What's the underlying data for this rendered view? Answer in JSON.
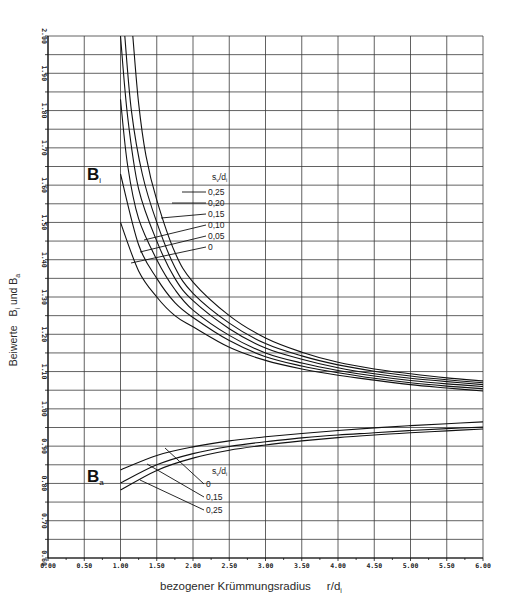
{
  "chart_data": {
    "type": "line",
    "title": "",
    "xlabel": "bezogener Krümmungsradius",
    "xlabel_unit": "r/d",
    "xlabel_unit_sub": "i",
    "ylabel": "Beiwerte",
    "ylabel_parts": [
      "B",
      "i",
      " und ",
      "B",
      "a"
    ],
    "xlim": [
      0,
      6
    ],
    "ylim": [
      0.6,
      2.0
    ],
    "x_ticks": [
      "0.00",
      "0.50",
      "1.00",
      "1.50",
      "2.00",
      "2.50",
      "3.00",
      "3.50",
      "4.00",
      "4.50",
      "5.00",
      "5.50",
      "6.00"
    ],
    "y_ticks": [
      "0.60",
      "0.70",
      "0.80",
      "0.90",
      "1.00",
      "1.10",
      "1.20",
      "1.30",
      "1.40",
      "1.50",
      "1.60",
      "1.70",
      "1.80",
      "1.90",
      "2.00"
    ],
    "grid": true,
    "legend_header": "s",
    "legend_header_sub": "v",
    "legend_header_tail": "/d",
    "legend_header_tail_sub": "i",
    "groups": [
      {
        "name": "B_i",
        "label": "B",
        "label_sub": "i",
        "series": [
          {
            "name": "0",
            "x": [
              1.0,
              1.25,
              1.5,
              1.75,
              2.0,
              2.5,
              3.0,
              3.5,
              4.0,
              4.5,
              5.0,
              5.5,
              6.0
            ],
            "y": [
              1.5,
              1.37,
              1.3,
              1.25,
              1.22,
              1.165,
              1.13,
              1.107,
              1.09,
              1.077,
              1.065,
              1.056,
              1.048
            ]
          },
          {
            "name": "0,05",
            "x": [
              1.0,
              1.25,
              1.5,
              1.75,
              2.0,
              2.5,
              3.0,
              3.5,
              4.0,
              4.5,
              5.0,
              5.5,
              6.0
            ],
            "y": [
              1.63,
              1.44,
              1.35,
              1.285,
              1.245,
              1.183,
              1.14,
              1.115,
              1.097,
              1.082,
              1.07,
              1.061,
              1.054
            ]
          },
          {
            "name": "0,10",
            "x": [
              1.0,
              1.1,
              1.25,
              1.5,
              1.75,
              2.0,
              2.5,
              3.0,
              3.5,
              4.0,
              4.5,
              5.0,
              5.5,
              6.0
            ],
            "y": [
              1.83,
              1.65,
              1.51,
              1.4,
              1.32,
              1.265,
              1.197,
              1.15,
              1.123,
              1.103,
              1.088,
              1.076,
              1.067,
              1.06
            ]
          },
          {
            "name": "0,15",
            "x": [
              1.0,
              1.1,
              1.25,
              1.5,
              1.75,
              2.0,
              2.5,
              3.0,
              3.5,
              4.0,
              4.5,
              5.0,
              5.5,
              6.0
            ],
            "y": [
              2.0,
              1.78,
              1.59,
              1.45,
              1.35,
              1.29,
              1.215,
              1.163,
              1.133,
              1.11,
              1.094,
              1.082,
              1.073,
              1.065
            ]
          },
          {
            "name": "0,20",
            "x": [
              1.06,
              1.15,
              1.3,
              1.5,
              1.75,
              2.0,
              2.5,
              3.0,
              3.5,
              4.0,
              4.5,
              5.0,
              5.5,
              6.0
            ],
            "y": [
              2.0,
              1.8,
              1.63,
              1.5,
              1.38,
              1.31,
              1.23,
              1.175,
              1.142,
              1.118,
              1.101,
              1.088,
              1.078,
              1.07
            ]
          },
          {
            "name": "0,25",
            "x": [
              1.17,
              1.25,
              1.35,
              1.5,
              1.75,
              2.0,
              2.5,
              3.0,
              3.5,
              4.0,
              4.5,
              5.0,
              5.5,
              6.0
            ],
            "y": [
              2.0,
              1.82,
              1.68,
              1.56,
              1.42,
              1.34,
              1.25,
              1.19,
              1.152,
              1.125,
              1.107,
              1.094,
              1.083,
              1.075
            ]
          }
        ]
      },
      {
        "name": "B_a",
        "label": "B",
        "label_sub": "a",
        "series": [
          {
            "name": "0",
            "x": [
              1.0,
              1.5,
              2.0,
              2.5,
              3.0,
              3.5,
              4.0,
              4.5,
              5.0,
              5.5,
              6.0
            ],
            "y": [
              0.836,
              0.875,
              0.898,
              0.914,
              0.925,
              0.934,
              0.942,
              0.949,
              0.955,
              0.96,
              0.965
            ]
          },
          {
            "name": "0,15",
            "x": [
              1.0,
              1.5,
              2.0,
              2.5,
              3.0,
              3.5,
              4.0,
              4.5,
              5.0,
              5.5,
              6.0
            ],
            "y": [
              0.801,
              0.85,
              0.88,
              0.899,
              0.912,
              0.922,
              0.93,
              0.936,
              0.942,
              0.947,
              0.951
            ]
          },
          {
            "name": "0,25",
            "x": [
              1.0,
              1.5,
              2.0,
              2.5,
              3.0,
              3.5,
              4.0,
              4.5,
              5.0,
              5.5,
              6.0
            ],
            "y": [
              0.782,
              0.835,
              0.868,
              0.889,
              0.903,
              0.914,
              0.923,
              0.93,
              0.936,
              0.941,
              0.946
            ]
          }
        ]
      }
    ],
    "annotations": {
      "bi_labels": [
        {
          "text": "0,25",
          "px": 208,
          "py": 192,
          "tx": 182,
          "ty": 192
        },
        {
          "text": "0,20",
          "px": 208,
          "py": 203,
          "tx": 172,
          "ty": 203
        },
        {
          "text": "0,15",
          "px": 208,
          "py": 214,
          "tx": 161,
          "ty": 218
        },
        {
          "text": "0,10",
          "px": 208,
          "py": 225,
          "tx": 144,
          "ty": 240
        },
        {
          "text": "0,05",
          "px": 208,
          "py": 236,
          "tx": 140,
          "ty": 252
        },
        {
          "text": "0",
          "px": 208,
          "py": 247,
          "tx": 131,
          "ty": 263
        }
      ],
      "ba_labels": [
        {
          "text": "0",
          "px": 206,
          "py": 484,
          "tx": 165,
          "ty": 448
        },
        {
          "text": "0,15",
          "px": 206,
          "py": 497,
          "tx": 147,
          "ty": 464
        },
        {
          "text": "0,25",
          "px": 206,
          "py": 510,
          "tx": 140,
          "ty": 480
        }
      ],
      "bi_header": {
        "x": 212,
        "y": 180
      },
      "ba_header": {
        "x": 212,
        "y": 474
      },
      "bi_big": {
        "x": 87,
        "y": 180
      },
      "ba_big": {
        "x": 87,
        "y": 482
      }
    }
  }
}
